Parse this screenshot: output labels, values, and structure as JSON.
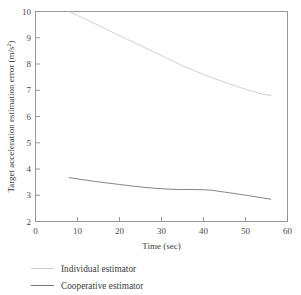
{
  "figure": {
    "background": "#ffffff",
    "frame_color": "#8d8d8d"
  },
  "chart_data": {
    "type": "line",
    "title": "",
    "xlabel": "Time (sec)",
    "ylabel": "Target acceleration estimation error (m/s",
    "ylabel_sup": "2",
    "ylabel_tail": ")",
    "xlim": [
      0,
      60
    ],
    "ylim": [
      2,
      10
    ],
    "xticks": [
      0,
      10,
      20,
      30,
      40,
      50,
      60
    ],
    "xticklabels": [
      "0",
      "10",
      "20",
      "30",
      "40",
      "50",
      "60"
    ],
    "yticks": [
      2,
      3,
      4,
      5,
      6,
      7,
      8,
      9,
      10
    ],
    "yticklabels": [
      "2",
      "3",
      "4",
      "5",
      "6",
      "7",
      "8",
      "9",
      "10"
    ],
    "grid": false,
    "legend_position": "below-axes",
    "series": [
      {
        "name": "Individual estimator",
        "color": "#c9c9c9",
        "x": [
          8.0,
          10.0,
          13.0,
          16.0,
          19.0,
          22.0,
          25.0,
          28.0,
          31.0,
          34.0,
          37.0,
          40.0,
          43.0,
          46.0,
          49.0,
          52.0,
          54.0,
          56.0
        ],
        "y": [
          10.0,
          9.85,
          9.62,
          9.39,
          9.16,
          8.93,
          8.7,
          8.47,
          8.24,
          8.01,
          7.8,
          7.6,
          7.42,
          7.25,
          7.09,
          6.94,
          6.86,
          6.8
        ]
      },
      {
        "name": "Cooperative estimator",
        "color": "#6f6f6f",
        "x": [
          8.0,
          11.0,
          14.0,
          17.0,
          20.0,
          23.0,
          26.0,
          29.0,
          32.0,
          34.0,
          37.0,
          40.0,
          42.0,
          45.0,
          48.0,
          51.0,
          54.0,
          56.0
        ],
        "y": [
          3.67,
          3.6,
          3.53,
          3.47,
          3.41,
          3.35,
          3.3,
          3.26,
          3.23,
          3.22,
          3.22,
          3.21,
          3.19,
          3.12,
          3.05,
          2.98,
          2.9,
          2.85
        ]
      }
    ],
    "legend": [
      {
        "label": "Individual estimator",
        "color": "#c9c9c9"
      },
      {
        "label": "Cooperative estimator",
        "color": "#6f6f6f"
      }
    ]
  }
}
